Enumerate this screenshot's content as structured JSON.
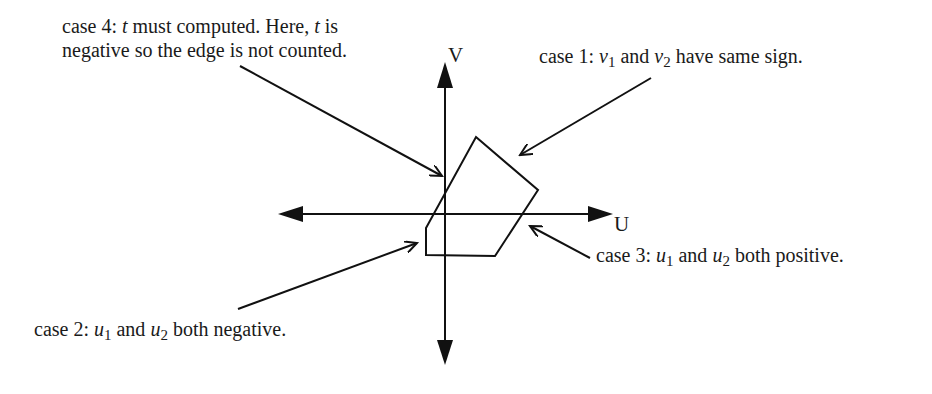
{
  "diagram": {
    "axes": {
      "u_label": "U",
      "v_label": "V",
      "origin": [
        445,
        214
      ],
      "u_range_px": [
        278,
        613
      ],
      "v_range_px": [
        62,
        365
      ]
    },
    "polygon": {
      "vertices": [
        [
          476,
          137
        ],
        [
          538,
          190
        ],
        [
          495,
          256
        ],
        [
          426,
          255
        ],
        [
          426,
          228
        ]
      ]
    },
    "annotations": {
      "case4": {
        "line1_a": "case 4: ",
        "line1_t": "t",
        "line1_b": " must computed.  Here, ",
        "line1_t2": "t",
        "line1_c": " is",
        "line2": "negative so the edge is not counted.",
        "leader": [
          [
            240,
            66
          ],
          [
            442,
            176
          ]
        ]
      },
      "case1": {
        "prefix": "case 1: ",
        "var1": "v",
        "sub1": "1",
        "mid": " and ",
        "var2": "v",
        "sub2": "2",
        "suffix": " have same sign.",
        "leader": [
          [
            651,
            78
          ],
          [
            520,
            155
          ]
        ]
      },
      "case3": {
        "prefix": "case 3: ",
        "var1": "u",
        "sub1": "1",
        "mid": " and ",
        "var2": "u",
        "sub2": "2",
        "suffix": " both positive.",
        "leader": [
          [
            590,
            258
          ],
          [
            530,
            226
          ]
        ]
      },
      "case2": {
        "prefix": "case 2: ",
        "var1": "u",
        "sub1": "1",
        "mid": " and ",
        "var2": "u",
        "sub2": "2",
        "suffix": " both negative.",
        "leader": [
          [
            238,
            309
          ],
          [
            417,
            243
          ]
        ]
      }
    },
    "colors": {
      "stroke": "#111111",
      "background": "#ffffff"
    }
  }
}
